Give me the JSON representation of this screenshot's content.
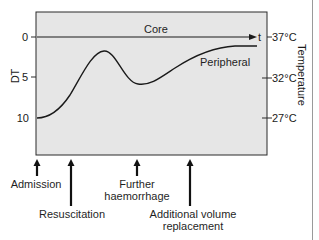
{
  "diagram": {
    "y_axis_left": {
      "label": "DT",
      "ticks": [
        "0",
        "5",
        "10"
      ]
    },
    "y_axis_right": {
      "label": "Temperature",
      "ticks": [
        "37°C",
        "32°C",
        "27°C"
      ]
    },
    "time_marker": "t",
    "series": {
      "core": {
        "label": "Core"
      },
      "peripheral": {
        "label": "Peripheral"
      }
    },
    "events": [
      {
        "label_lines": [
          "Admission"
        ]
      },
      {
        "label_lines": [
          "Resuscitation"
        ]
      },
      {
        "label_lines": [
          "Further",
          "haemorrhage"
        ]
      },
      {
        "label_lines": [
          "Additional volume",
          "replacement"
        ]
      }
    ],
    "colors": {
      "plot_fill": "#e6e6e6",
      "line": "#1a1a1a",
      "page_edge": "#9a9a9a"
    }
  }
}
